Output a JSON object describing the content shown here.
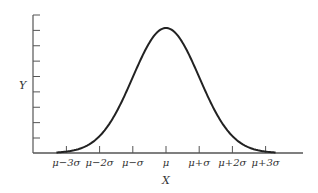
{
  "chart_data": {
    "type": "line",
    "title": "",
    "xlabel": "X",
    "ylabel": "Y",
    "x_tick_labels": [
      "μ−3σ",
      "μ−2σ",
      "μ−σ",
      "μ",
      "μ+σ",
      "μ+2σ",
      "μ+3σ"
    ],
    "x_tick_values": [
      -3,
      -2,
      -1,
      0,
      1,
      2,
      3
    ],
    "y_tick_count": 9,
    "y_tick_labels": [],
    "series": [
      {
        "name": "normal density",
        "function": "exp(-z^2/2)",
        "x": [
          -3.3,
          -3,
          -2.5,
          -2,
          -1.5,
          -1,
          -0.5,
          0,
          0.5,
          1,
          1.5,
          2,
          2.5,
          3,
          3.3
        ],
        "values": [
          0.004,
          0.011,
          0.044,
          0.135,
          0.325,
          0.607,
          0.882,
          1.0,
          0.882,
          0.607,
          0.325,
          0.135,
          0.044,
          0.011,
          0.004
        ]
      }
    ],
    "xlim": [
      -3.3,
      4.1
    ],
    "ylim": [
      0,
      1.12
    ],
    "grid": false,
    "legend": null
  },
  "colors": {
    "axis": "#555555",
    "curve": "#222222",
    "text": "#333333"
  }
}
